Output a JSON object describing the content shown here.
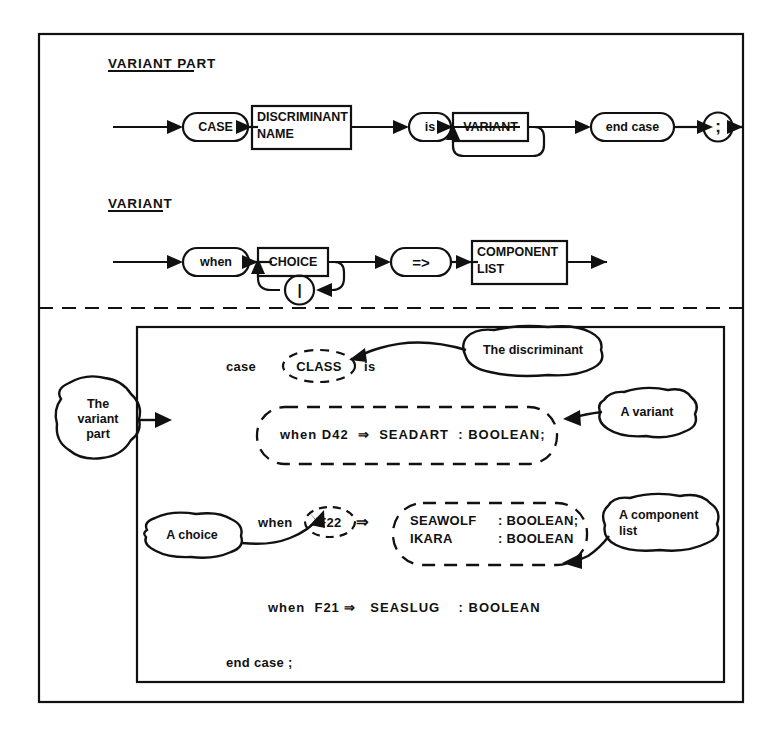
{
  "figure": {
    "type": "railroad-syntax-diagram-with-example",
    "background_color": "#ffffff",
    "ink_color": "#000000"
  },
  "upper_panel": {
    "diagrams": [
      {
        "title": "VARIANT PART",
        "nodes": [
          {
            "id": "case",
            "label": "CASE",
            "shape": "rounded-terminal"
          },
          {
            "id": "discriminant-name",
            "label_line1": "DISCRIMINANT",
            "label_line2": "NAME",
            "shape": "rect-nonterminal"
          },
          {
            "id": "is",
            "label": "is",
            "shape": "rounded-terminal"
          },
          {
            "id": "variant",
            "label": "VARIANT",
            "shape": "rect-nonterminal",
            "loop": true
          },
          {
            "id": "end-case",
            "label": "end case",
            "shape": "rounded-terminal"
          },
          {
            "id": "semicolon",
            "label": ";",
            "shape": "circle-terminal"
          }
        ]
      },
      {
        "title": "VARIANT",
        "nodes": [
          {
            "id": "when",
            "label": "when",
            "shape": "rounded-terminal"
          },
          {
            "id": "choice",
            "label": "CHOICE",
            "shape": "rect-nonterminal",
            "loop": true
          },
          {
            "id": "bar",
            "label": "|",
            "shape": "circle-terminal"
          },
          {
            "id": "arrow-op",
            "label": "=>",
            "shape": "rounded-terminal"
          },
          {
            "id": "component-list",
            "label_line1": "COMPONENT",
            "label_line2": "LIST",
            "shape": "rect-nonterminal"
          }
        ]
      }
    ]
  },
  "lower_panel": {
    "code_lines": [
      {
        "id": "line-case",
        "parts": [
          "case",
          "CLASS",
          "is"
        ]
      },
      {
        "id": "line-variant-1",
        "text": "when D42  ⇒  SEADART  : BOOLEAN;"
      },
      {
        "id": "line-variant-2-when",
        "text": "when"
      },
      {
        "id": "line-variant-2-choice",
        "text": "F22"
      },
      {
        "id": "line-variant-2-arrow",
        "text": "⇒"
      },
      {
        "id": "line-variant-2-comp-1",
        "name": "SEAWOLF",
        "type": ": BOOLEAN;"
      },
      {
        "id": "line-variant-2-comp-2",
        "name": "IKARA",
        "type": ": BOOLEAN"
      },
      {
        "id": "line-variant-3",
        "text": "when  F21 ⇒   SEASLUG    : BOOLEAN"
      },
      {
        "id": "line-end",
        "text": "end case ;"
      }
    ],
    "code_text": {
      "case_keyword": "case",
      "class_discriminant": "CLASS",
      "is_keyword": "is",
      "variant1": "when D42  ⇒  SEADART  : BOOLEAN;",
      "variant2_when": "when",
      "variant2_choice": "F22",
      "variant2_arrow": "⇒",
      "comp_seawolf_name": "SEAWOLF",
      "comp_seawolf_type": ": BOOLEAN;",
      "comp_ikara_name": "IKARA",
      "comp_ikara_type": ": BOOLEAN",
      "variant3": "when  F21 ⇒   SEASLUG    : BOOLEAN",
      "end_case": "end case ;"
    },
    "callouts": [
      {
        "id": "the-variant-part",
        "lines": [
          "The",
          "variant",
          "part"
        ],
        "points_to": "variant-part-block"
      },
      {
        "id": "the-discriminant",
        "lines": [
          "The discriminant"
        ],
        "points_to": "class-discriminant"
      },
      {
        "id": "a-variant",
        "lines": [
          "A variant"
        ],
        "points_to": "variant1-block"
      },
      {
        "id": "a-choice",
        "lines": [
          "A choice"
        ],
        "points_to": "f22-choice"
      },
      {
        "id": "a-component-list",
        "lines": [
          "A component",
          "list"
        ],
        "points_to": "component-list-block"
      }
    ]
  }
}
